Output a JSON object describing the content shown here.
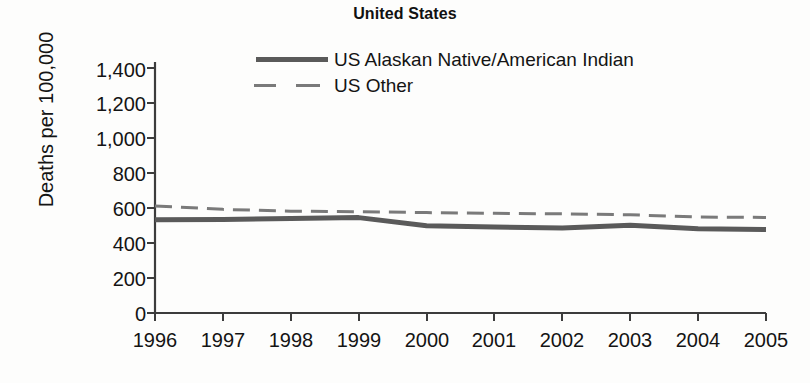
{
  "chart_data": {
    "type": "line",
    "title": "United States",
    "xlabel": "",
    "ylabel": "Deaths per 100,000",
    "x": [
      1996,
      1997,
      1998,
      1999,
      2000,
      2001,
      2002,
      2003,
      2004,
      2005
    ],
    "xtick_labels": [
      "1996",
      "1997",
      "1998",
      "1999",
      "2000",
      "2001",
      "2002",
      "2003",
      "2004",
      "2005"
    ],
    "ytick_labels": [
      "1,400",
      "1,200",
      "1,000",
      "800",
      "600",
      "400",
      "200",
      "0"
    ],
    "ytick_values": [
      1400,
      1200,
      1000,
      800,
      600,
      400,
      200,
      0
    ],
    "ylim": [
      0,
      1400
    ],
    "xlim": [
      1996,
      2005
    ],
    "grid": false,
    "legend_position": "inside-top-center",
    "series": [
      {
        "name": "US Alaskan Native/American Indian",
        "style": "solid",
        "color": "#5a5a5a",
        "width": 5,
        "values": [
          520,
          522,
          527,
          532,
          487,
          480,
          474,
          490,
          470,
          466
        ]
      },
      {
        "name": "US Other",
        "style": "dashed",
        "color": "#7a7a7a",
        "width": 3,
        "values": [
          597,
          578,
          568,
          565,
          560,
          556,
          553,
          548,
          535,
          533
        ]
      }
    ]
  },
  "legend": {
    "entries": [
      {
        "label": "US Alaskan Native/American Indian",
        "swatch": "solid-line-swatch"
      },
      {
        "label": "US Other",
        "swatch": "dashed-line-swatch"
      }
    ]
  },
  "colors": {
    "series_native": "#5a5a5a",
    "series_other": "#7a7a7a",
    "axis": "#3c3c3c",
    "text": "#141414",
    "background": "#fdfdfc"
  }
}
